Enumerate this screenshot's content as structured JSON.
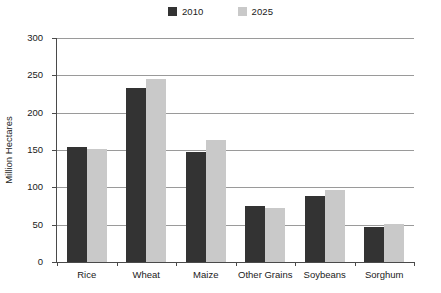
{
  "chart_data": {
    "type": "bar",
    "title": "",
    "subtitle": "",
    "xlabel": "",
    "ylabel": "Million Hectares",
    "ylim": [
      0,
      300
    ],
    "yticks": [
      0,
      50,
      100,
      150,
      200,
      250,
      300
    ],
    "ytick_labels": [
      "0",
      "50",
      "100",
      "150",
      "200",
      "250",
      "300"
    ],
    "grid": true,
    "legend_position": "top-center",
    "categories": [
      "Rice",
      "Wheat",
      "Maize",
      "Other Grains",
      "Soybeans",
      "Sorghum"
    ],
    "series": [
      {
        "name": "2010",
        "color": "#333333",
        "values": [
          154,
          233,
          148,
          75,
          89,
          47
        ]
      },
      {
        "name": "2025",
        "color": "#c9c9c9",
        "values": [
          151,
          245,
          164,
          73,
          96,
          51
        ]
      }
    ]
  },
  "legend": {
    "items": [
      {
        "label": "2010",
        "color": "#333333",
        "swatch_name": "legend-swatch-2010"
      },
      {
        "label": "2025",
        "color": "#c9c9c9",
        "swatch_name": "legend-swatch-2025"
      }
    ]
  },
  "axes": {
    "y_title": "Million Hectares",
    "y_tick_labels": [
      "300",
      "250",
      "200",
      "150",
      "100",
      "50",
      "0"
    ],
    "x_tick_labels": [
      "Rice",
      "Wheat",
      "Maize",
      "Other Grains",
      "Soybeans",
      "Sorghum"
    ]
  },
  "colors": {
    "series_2010": "#333333",
    "series_2025": "#c9c9c9",
    "gridline": "#9a9a9a",
    "axis": "#4a4a4a",
    "text": "#1a1a1a",
    "background": "#ffffff"
  }
}
